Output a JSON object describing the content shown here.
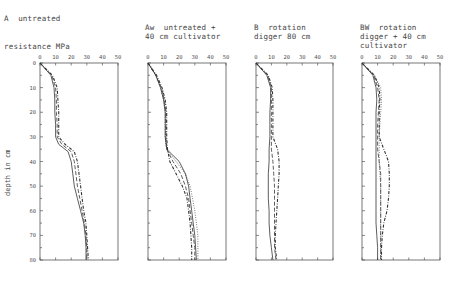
{
  "figure": {
    "ylabel": "depth in cm",
    "xlabel": "resistance MPa"
  },
  "chart_data": [
    {
      "type": "line",
      "title": "A  untreated",
      "xlabel": "resistance MPa",
      "ylabel": "depth in cm",
      "xticks": [
        0,
        10,
        20,
        30,
        40,
        50
      ],
      "yticks": [
        0,
        10,
        20,
        30,
        40,
        50,
        60,
        70,
        80
      ],
      "xlim": [
        0,
        50
      ],
      "ylim": [
        80,
        0
      ],
      "depth": [
        0,
        5,
        10,
        15,
        20,
        25,
        30,
        33,
        36,
        40,
        45,
        50,
        55,
        60,
        65,
        70,
        75,
        80
      ],
      "series": [
        {
          "name": "solid",
          "style": "solid",
          "values": [
            0,
            7,
            9,
            9.5,
            9.5,
            10,
            10,
            12,
            18,
            20,
            21,
            22,
            24,
            26,
            28,
            29,
            29.5,
            29.5
          ]
        },
        {
          "name": "dashed",
          "style": "dashed",
          "values": [
            0,
            7.5,
            10,
            10.5,
            10.5,
            11,
            11,
            14,
            20,
            22,
            23,
            24,
            25.5,
            27,
            28.5,
            29.5,
            30,
            30
          ]
        },
        {
          "name": "dash-dot",
          "style": "dashdot",
          "values": [
            0,
            8,
            11,
            11.5,
            12,
            12,
            12,
            16,
            22,
            24,
            25,
            26,
            27,
            28,
            29.5,
            30,
            30.5,
            31
          ]
        }
      ]
    },
    {
      "type": "line",
      "title": "Aw  untreated +\n40 cm cultivator",
      "xticks": [
        0,
        10,
        20,
        30,
        40,
        50
      ],
      "xlim": [
        0,
        50
      ],
      "ylim": [
        80,
        0
      ],
      "depth": [
        0,
        5,
        10,
        15,
        20,
        25,
        30,
        35,
        40,
        45,
        50,
        55,
        60,
        65,
        70,
        75,
        80
      ],
      "series": [
        {
          "name": "solid",
          "style": "solid",
          "values": [
            0,
            5,
            8,
            10,
            11,
            11,
            11,
            12,
            20,
            24,
            26,
            27,
            28,
            29,
            30,
            30.5,
            31
          ]
        },
        {
          "name": "dashed",
          "style": "dashed",
          "values": [
            0,
            5,
            8.5,
            10.5,
            11.5,
            11.5,
            11.5,
            12,
            16,
            21,
            24,
            26,
            27,
            28,
            29,
            30,
            30
          ]
        },
        {
          "name": "dash-dot",
          "style": "dashdot",
          "values": [
            0,
            5.5,
            9,
            11,
            12,
            12,
            12,
            12.5,
            14,
            18,
            22,
            25,
            26,
            27,
            27.5,
            28,
            28
          ]
        },
        {
          "name": "dotted",
          "style": "dotted",
          "values": [
            0,
            5,
            8,
            10,
            11,
            11,
            11,
            12,
            18,
            24,
            27,
            28.5,
            30,
            31,
            32,
            32,
            32
          ]
        }
      ]
    },
    {
      "type": "line",
      "title": "B  rotation\ndigger 80 cm",
      "xticks": [
        0,
        10,
        20,
        30,
        40,
        50
      ],
      "xlim": [
        0,
        50
      ],
      "ylim": [
        80,
        0
      ],
      "depth": [
        0,
        5,
        10,
        15,
        20,
        25,
        30,
        35,
        40,
        45,
        50,
        55,
        60,
        65,
        70,
        75,
        80
      ],
      "series": [
        {
          "name": "solid",
          "style": "solid",
          "values": [
            0,
            7,
            9.5,
            9.5,
            9,
            9,
            9,
            8.5,
            8.5,
            8,
            8,
            8,
            8.5,
            8.5,
            9,
            10,
            11
          ]
        },
        {
          "name": "dashed",
          "style": "dashed",
          "values": [
            0,
            7.5,
            10,
            10,
            10,
            10,
            10,
            10,
            11,
            11.5,
            12,
            12,
            12,
            12,
            12,
            12,
            13
          ]
        },
        {
          "name": "dash-dot",
          "style": "dashdot",
          "values": [
            0,
            8,
            10.5,
            11,
            11,
            11,
            11,
            14,
            15,
            15,
            14.5,
            14,
            13.5,
            13,
            12.5,
            12.5,
            13.5
          ]
        }
      ]
    },
    {
      "type": "line",
      "title": "BW  rotation\ndigger + 40 cm\ncultivator",
      "xticks": [
        0,
        10,
        20,
        30,
        40,
        50
      ],
      "xlim": [
        0,
        50
      ],
      "ylim": [
        80,
        0
      ],
      "depth": [
        0,
        5,
        10,
        15,
        20,
        25,
        30,
        35,
        40,
        45,
        50,
        55,
        60,
        65,
        70,
        75,
        80
      ],
      "series": [
        {
          "name": "solid",
          "style": "solid",
          "values": [
            0,
            7,
            9,
            9.5,
            9,
            9,
            9,
            9,
            9,
            9,
            9,
            9,
            9,
            9,
            9.5,
            10,
            10
          ]
        },
        {
          "name": "dashed",
          "style": "dashed",
          "values": [
            0,
            7.5,
            10,
            11,
            10.5,
            10,
            10,
            10,
            11,
            12,
            12,
            12,
            12,
            12,
            12,
            12,
            12
          ]
        },
        {
          "name": "dash-dot",
          "style": "dashdot",
          "values": [
            0,
            8,
            11,
            11.5,
            11,
            11,
            11,
            14,
            17,
            17.5,
            17.5,
            17,
            16,
            14,
            13,
            12.5,
            12.5
          ]
        },
        {
          "name": "dotted",
          "style": "dotted",
          "values": [
            0,
            8,
            12,
            12.5,
            12,
            11.5,
            11,
            11,
            11,
            11.5,
            12,
            12,
            12,
            12,
            12,
            12,
            12
          ]
        }
      ]
    }
  ]
}
